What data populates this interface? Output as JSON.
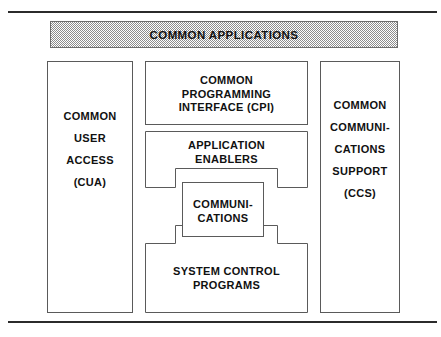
{
  "diagram": {
    "title": "COMMON APPLICATIONS",
    "banner": {
      "label": "COMMON APPLICATIONS",
      "fill": "#8d8d8d",
      "border": "#6e6e6e"
    },
    "rules": {
      "top": "horizontal-rule",
      "bottom": "horizontal-rule",
      "color": "#2b2b2b"
    },
    "columns": {
      "left": {
        "name": "common-user-access",
        "lines": [
          "COMMON",
          "USER",
          "ACCESS",
          "(CUA)"
        ],
        "line1": "COMMON",
        "line2": "USER",
        "line3": "ACCESS",
        "line4": "(CUA)"
      },
      "right": {
        "name": "common-communications-support",
        "lines": [
          "COMMON",
          "COMMUNI-",
          "CATIONS",
          "SUPPORT",
          "(CCS)"
        ],
        "line1": "COMMON",
        "line2": "COMMUNI-",
        "line3": "CATIONS",
        "line4": "SUPPORT",
        "line5": "(CCS)"
      }
    },
    "center_stack": {
      "cpi": {
        "name": "common-programming-interface",
        "lines": [
          "COMMON",
          "PROGRAMMING",
          "INTERFACE (CPI)"
        ],
        "line1": "COMMON",
        "line2": "PROGRAMMING",
        "line3": "INTERFACE (CPI)"
      },
      "enablers": {
        "name": "application-enablers",
        "lines": [
          "APPLICATION",
          "ENABLERS"
        ],
        "line1": "APPLICATION",
        "line2": "ENABLERS"
      },
      "communications": {
        "name": "communications",
        "lines": [
          "COMMUNI-",
          "CATIONS"
        ],
        "line1": "COMMUNI-",
        "line2": "CATIONS"
      },
      "system_control": {
        "name": "system-control-programs",
        "lines": [
          "SYSTEM CONTROL",
          "PROGRAMS"
        ],
        "line1": "SYSTEM CONTROL",
        "line2": "PROGRAMS"
      }
    }
  }
}
